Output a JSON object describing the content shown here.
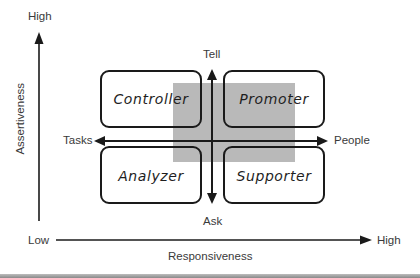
{
  "diagram": {
    "type": "2x2 quadrant model",
    "vertical_axis": {
      "label": "Assertiveness",
      "high_label": "High"
    },
    "horizontal_axis": {
      "label": "Responsiveness",
      "low_label": "Low",
      "high_label": "High"
    },
    "inner_vertical_axis": {
      "top_label": "Tell",
      "bottom_label": "Ask"
    },
    "inner_horizontal_axis": {
      "left_label": "Tasks",
      "right_label": "People"
    },
    "quadrants": [
      {
        "position": "top-left",
        "label": "Controller"
      },
      {
        "position": "top-right",
        "label": "Promoter"
      },
      {
        "position": "bottom-left",
        "label": "Analyzer"
      },
      {
        "position": "bottom-right",
        "label": "Supporter"
      }
    ],
    "colors": {
      "line": "#1a1a1a",
      "highlight_fill": "#b9b9b9",
      "text": "#3a3a3a",
      "background": "#ffffff"
    }
  }
}
